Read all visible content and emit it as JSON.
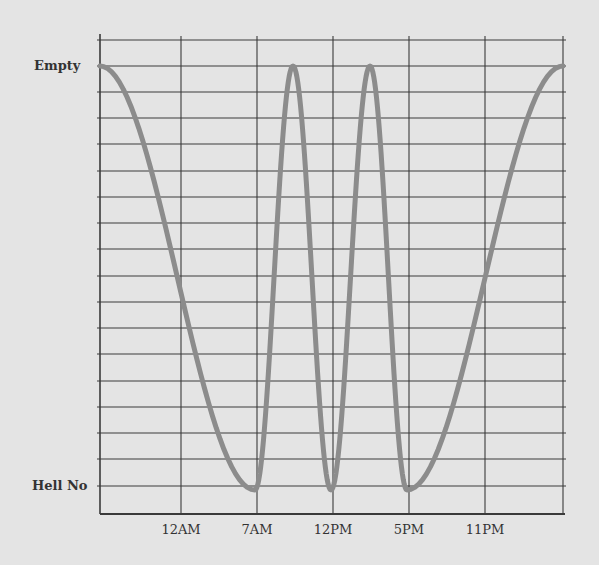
{
  "chart_data": {
    "type": "line",
    "title": "",
    "xlabel": "",
    "ylabel": "",
    "x_tick_labels": [
      "12AM",
      "7AM",
      "12PM",
      "5PM",
      "11PM"
    ],
    "y_tick_labels": {
      "top": "Empty",
      "bottom": "Hell No"
    },
    "ylim": [
      0,
      1
    ],
    "grid": true,
    "legend": null,
    "series": [
      {
        "name": "level",
        "color": "#8c8c8c",
        "points": [
          {
            "x_px": 100,
            "y": 1
          },
          {
            "x_px": 255,
            "y": 0
          },
          {
            "x_px": 293,
            "y": 1
          },
          {
            "x_px": 331,
            "y": 0
          },
          {
            "x_px": 370,
            "y": 1
          },
          {
            "x_px": 407,
            "y": 0
          },
          {
            "x_px": 563,
            "y": 1
          }
        ]
      }
    ],
    "layout": {
      "plot_left": 100,
      "plot_right": 563,
      "grid_right": 566,
      "axis_top": 40,
      "axis_bottom": 514,
      "y_top_px": 66,
      "y_bottom_px": 490,
      "h_grid_y": [
        40,
        66,
        92,
        118,
        144,
        171,
        197,
        223,
        249,
        276,
        302,
        328,
        354,
        381,
        407,
        433,
        459,
        486
      ],
      "v_grid_x": [
        181,
        257,
        333,
        409,
        485,
        563
      ],
      "x_tick_positions": [
        181,
        257,
        333,
        409,
        485
      ],
      "grid_color": "#3a3a3a",
      "line_color": "#8c8c8c"
    }
  }
}
